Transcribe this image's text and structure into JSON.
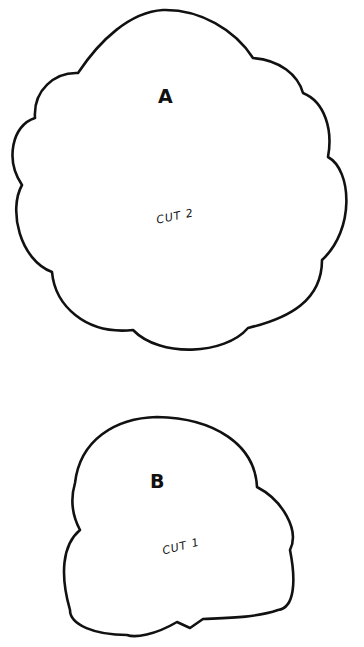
{
  "pattern_pieces": [
    {
      "id": "A",
      "label": "A",
      "instruction": "CUT 2"
    },
    {
      "id": "B",
      "label": "B",
      "instruction": "CUT 1"
    }
  ],
  "colors": {
    "line": "#111111",
    "background": "#ffffff"
  }
}
